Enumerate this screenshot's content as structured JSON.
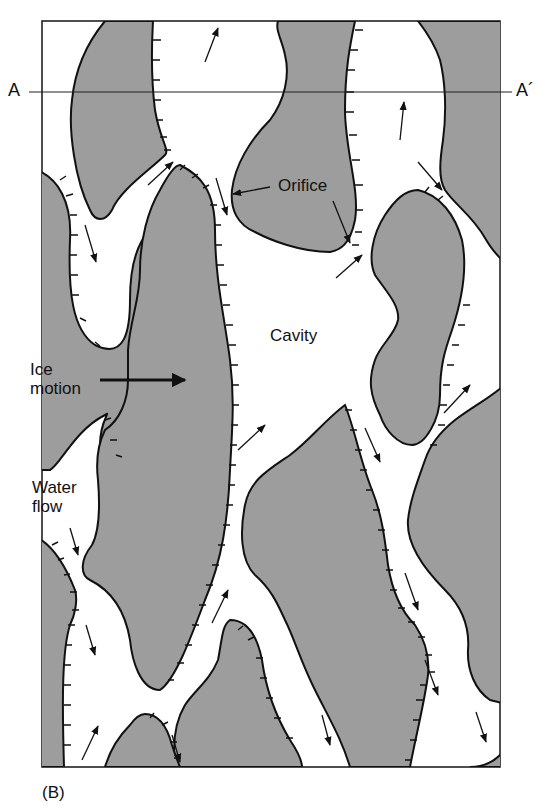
{
  "figure": {
    "panel_label": "(B)",
    "section_line": {
      "start_label": "A",
      "end_label": "A´"
    },
    "labels": {
      "orifice": "Orifice",
      "cavity": "Cavity",
      "ice_motion": "Ice\nmotion",
      "water_flow": "Water\nflow"
    },
    "colors": {
      "bed_fill": "#9d9d9d",
      "cavity_fill": "#ffffff",
      "outline": "#111111"
    },
    "legend_semantics": {
      "gray_regions": "bed / ice-bed contact",
      "white_regions": "water-filled cavities and orifices",
      "hachured_edges": "lee-side step faces",
      "small_arrows": "water flow direction",
      "bold_arrow": "ice motion direction (left to right)"
    }
  }
}
